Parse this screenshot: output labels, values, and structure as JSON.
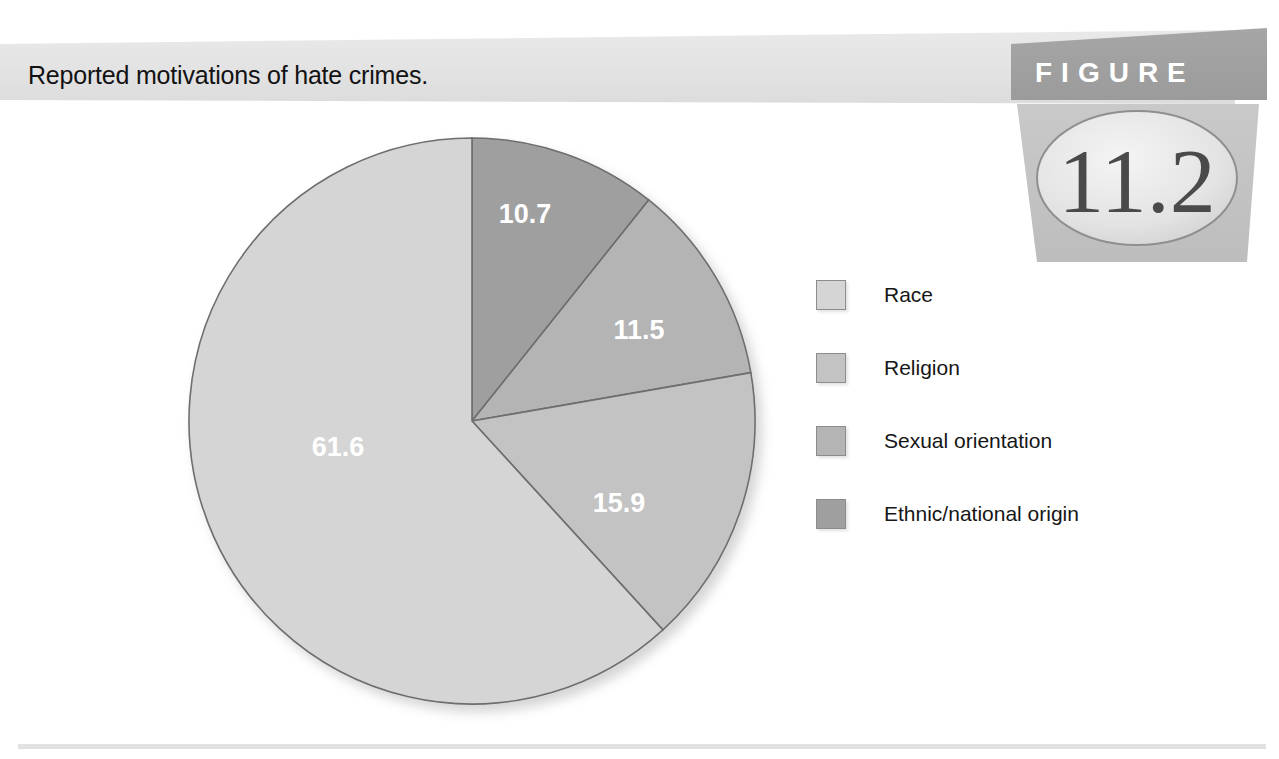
{
  "figure": {
    "title": "Reported motivations of hate crimes.",
    "badge_word": "FIGURE",
    "badge_number": "11.2"
  },
  "chart_data": {
    "type": "pie",
    "title": "Reported motivations of hate crimes.",
    "categories": [
      "Race",
      "Religion",
      "Sexual orientation",
      "Ethnic/national origin"
    ],
    "values": [
      61.6,
      15.9,
      11.5,
      10.7
    ],
    "value_labels": [
      "61.6",
      "15.9",
      "11.5",
      "10.7"
    ],
    "unit": "percent",
    "total": 99.7,
    "legend_position": "right",
    "grid": false,
    "xlabel": "",
    "ylabel": "",
    "colors": [
      "#d5d5d5",
      "#c3c3c3",
      "#b4b4b4",
      "#9f9f9f"
    ],
    "slice_order_clockwise_from_top": [
      "Ethnic/national origin",
      "Sexual orientation",
      "Religion",
      "Race"
    ],
    "stroke_color": "#6e6e6e"
  },
  "legend": {
    "items": [
      {
        "label": "Race",
        "color": "#d5d5d5",
        "value": 61.6
      },
      {
        "label": "Religion",
        "color": "#c3c3c3",
        "value": 15.9
      },
      {
        "label": "Sexual orientation",
        "color": "#b4b4b4",
        "value": 11.5
      },
      {
        "label": "Ethnic/national origin",
        "color": "#9f9f9f",
        "value": 10.7
      }
    ]
  },
  "slices": [
    {
      "name": "Ethnic/national origin",
      "label": "10.7",
      "value": 10.7,
      "color": "#9f9f9f",
      "label_x": 525,
      "label_y": 216
    },
    {
      "name": "Sexual orientation",
      "label": "11.5",
      "value": 11.5,
      "color": "#b4b4b4",
      "label_x": 639,
      "label_y": 332
    },
    {
      "name": "Religion",
      "label": "15.9",
      "value": 15.9,
      "color": "#c3c3c3",
      "label_x": 619,
      "label_y": 505
    },
    {
      "name": "Race",
      "label": "61.6",
      "value": 61.6,
      "color": "#d5d5d5",
      "label_x": 338,
      "label_y": 449
    }
  ],
  "geometry": {
    "center_x": 472,
    "center_y": 421,
    "radius": 283
  }
}
